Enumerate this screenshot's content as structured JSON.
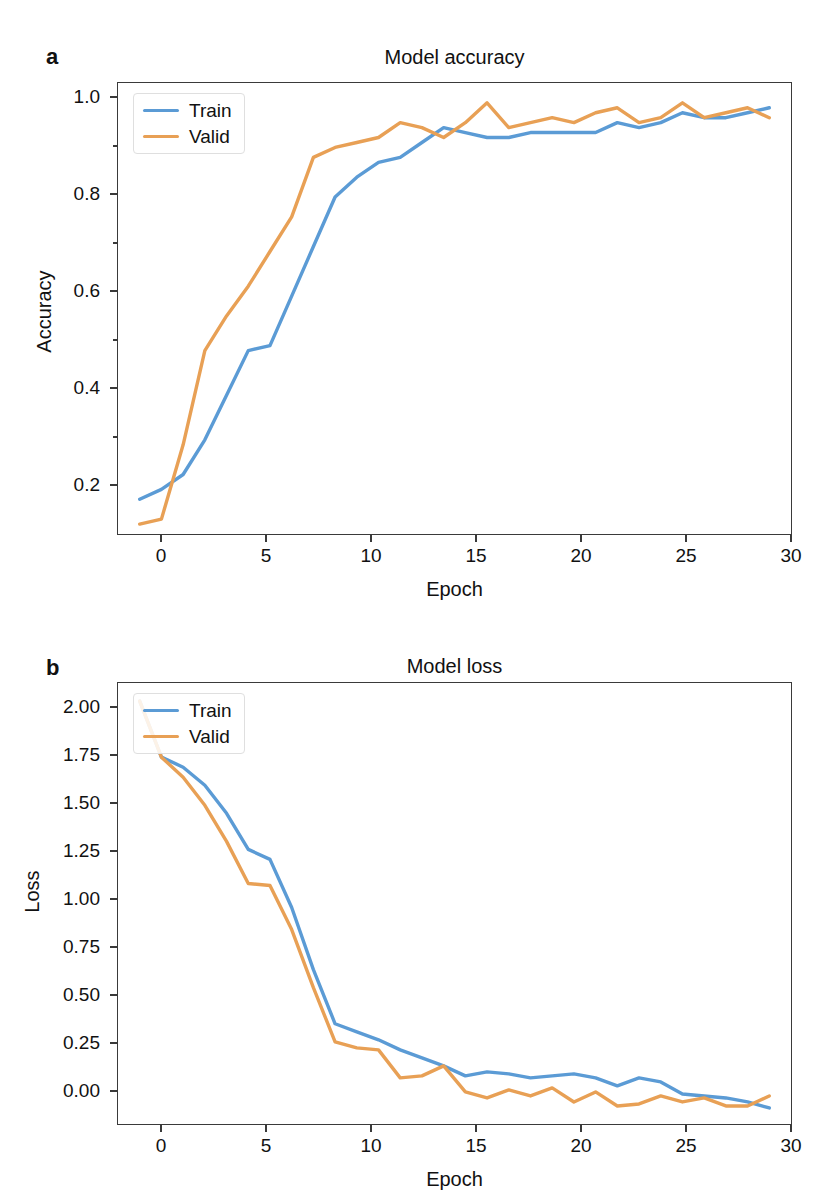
{
  "figure": {
    "panels": [
      {
        "letter": "a",
        "title": "Model accuracy",
        "xlabel": "Epoch",
        "ylabel": "Accuracy",
        "ytick_labels": [
          "1.0",
          "0.8",
          "0.6",
          "0.4",
          "0.2"
        ],
        "xtick_labels": [
          "0",
          "5",
          "10",
          "15",
          "20",
          "25",
          "30"
        ],
        "legend": [
          {
            "label": "Train",
            "color": "#5b9bd5"
          },
          {
            "label": "Valid",
            "color": "#e8a055"
          }
        ]
      },
      {
        "letter": "b",
        "title": "Model loss",
        "xlabel": "Epoch",
        "ylabel": "Loss",
        "ytick_labels": [
          "2.00",
          "1.75",
          "1.50",
          "1.25",
          "1.00",
          "0.75",
          "0.50",
          "0.25",
          "0.00"
        ],
        "xtick_labels": [
          "0",
          "5",
          "10",
          "15",
          "20",
          "25",
          "30"
        ],
        "legend": [
          {
            "label": "Train",
            "color": "#5b9bd5"
          },
          {
            "label": "Valid",
            "color": "#e8a055"
          }
        ]
      }
    ]
  },
  "colors": {
    "train": "#5b9bd5",
    "valid": "#e8a055",
    "axis": "#3a3a3a",
    "text": "#111111",
    "background": "#ffffff"
  },
  "chart_data": [
    {
      "type": "line",
      "title": "Model accuracy",
      "xlabel": "Epoch",
      "ylabel": "Accuracy",
      "xlim": [
        -1,
        30
      ],
      "ylim": [
        0.12,
        1.03
      ],
      "xticks": [
        0,
        5,
        10,
        15,
        20,
        25,
        30
      ],
      "yticks": [
        0.2,
        0.4,
        0.6,
        0.8,
        1.0
      ],
      "grid": false,
      "legend_position": "upper left",
      "x": [
        0,
        1,
        2,
        3,
        4,
        5,
        6,
        7,
        8,
        9,
        10,
        11,
        12,
        13,
        14,
        15,
        16,
        17,
        18,
        19,
        20,
        21,
        22,
        23,
        24,
        25,
        26,
        27,
        28,
        29
      ],
      "series": [
        {
          "name": "Train",
          "color": "#5b9bd5",
          "values": [
            0.19,
            0.21,
            0.24,
            0.31,
            0.4,
            0.49,
            0.5,
            0.6,
            0.7,
            0.8,
            0.84,
            0.87,
            0.88,
            0.91,
            0.94,
            0.93,
            0.92,
            0.92,
            0.93,
            0.93,
            0.93,
            0.93,
            0.95,
            0.94,
            0.95,
            0.97,
            0.96,
            0.96,
            0.97,
            0.98
          ]
        },
        {
          "name": "Valid",
          "color": "#e8a055",
          "values": [
            0.14,
            0.15,
            0.3,
            0.49,
            0.56,
            0.62,
            0.69,
            0.76,
            0.88,
            0.9,
            0.91,
            0.92,
            0.95,
            0.94,
            0.92,
            0.95,
            0.99,
            0.94,
            0.95,
            0.96,
            0.95,
            0.97,
            0.98,
            0.95,
            0.96,
            0.99,
            0.96,
            0.97,
            0.98,
            0.96
          ]
        }
      ]
    },
    {
      "type": "line",
      "title": "Model loss",
      "xlabel": "Epoch",
      "ylabel": "Loss",
      "xlim": [
        -1,
        30
      ],
      "ylim": [
        -0.05,
        2.15
      ],
      "xticks": [
        0,
        5,
        10,
        15,
        20,
        25,
        30
      ],
      "yticks": [
        0.0,
        0.25,
        0.5,
        0.75,
        1.0,
        1.25,
        1.5,
        1.75,
        2.0
      ],
      "grid": false,
      "legend_position": "upper left",
      "x": [
        0,
        1,
        2,
        3,
        4,
        5,
        6,
        7,
        8,
        9,
        10,
        11,
        12,
        13,
        14,
        15,
        16,
        17,
        18,
        19,
        20,
        21,
        22,
        23,
        24,
        25,
        26,
        27,
        28,
        29
      ],
      "series": [
        {
          "name": "Train",
          "color": "#5b9bd5",
          "values": [
            2.06,
            1.78,
            1.73,
            1.64,
            1.5,
            1.32,
            1.27,
            1.03,
            0.72,
            0.45,
            0.41,
            0.37,
            0.32,
            0.28,
            0.24,
            0.19,
            0.21,
            0.2,
            0.18,
            0.19,
            0.2,
            0.18,
            0.14,
            0.18,
            0.16,
            0.1,
            0.09,
            0.08,
            0.06,
            0.03
          ]
        },
        {
          "name": "Valid",
          "color": "#e8a055",
          "values": [
            2.06,
            1.78,
            1.68,
            1.54,
            1.36,
            1.15,
            1.14,
            0.92,
            0.63,
            0.36,
            0.33,
            0.32,
            0.18,
            0.19,
            0.24,
            0.11,
            0.08,
            0.12,
            0.09,
            0.13,
            0.06,
            0.11,
            0.04,
            0.05,
            0.09,
            0.06,
            0.08,
            0.04,
            0.04,
            0.09
          ]
        }
      ]
    }
  ]
}
